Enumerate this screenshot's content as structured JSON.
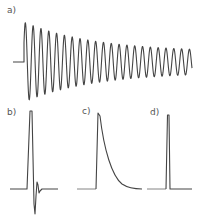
{
  "figure": {
    "panels": [
      {
        "id": "a",
        "label": "a)",
        "description": "decaying oscillation (ringing) after a step"
      },
      {
        "id": "b",
        "label": "b)",
        "description": "single sharp pulse with brief overshoot/undershoot"
      },
      {
        "id": "c",
        "label": "c)",
        "description": "sharp rise followed by exponential decay"
      },
      {
        "id": "d",
        "label": "d)",
        "description": "narrow single spike"
      }
    ],
    "colors": {
      "trace": "#444444",
      "baseline": "#777777",
      "background": "#ffffff"
    }
  }
}
